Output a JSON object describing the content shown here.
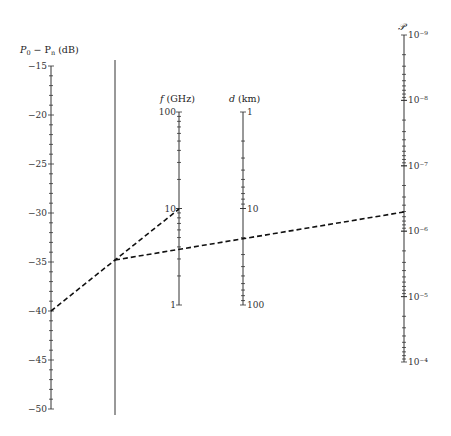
{
  "chart_data": {
    "type": "nomogram",
    "title": "",
    "axes": [
      {
        "id": "power",
        "label": "P0 − Pn (dB)",
        "scale": "linear",
        "range": [
          -15,
          -50
        ],
        "major_ticks": [
          -15,
          -20,
          -25,
          -30,
          -35,
          -40,
          -45,
          -50
        ],
        "tick_labels": [
          "−15",
          "−20",
          "−25",
          "−30",
          "−35",
          "−40",
          "−45",
          "−50"
        ],
        "minor_step": 1
      },
      {
        "id": "pivot",
        "label": "",
        "scale": "none",
        "note": "unlabeled reference (turning) line"
      },
      {
        "id": "frequency",
        "label": "f (GHz)",
        "scale": "log",
        "range": [
          100,
          1
        ],
        "tick_labels": [
          "100",
          "10",
          "1"
        ]
      },
      {
        "id": "distance",
        "label": "d (km)",
        "scale": "log",
        "range": [
          1,
          100
        ],
        "tick_labels": [
          "1",
          "10",
          "100"
        ]
      },
      {
        "id": "probability",
        "label": "𝒫",
        "scale": "log",
        "range": [
          1e-09,
          0.0001
        ],
        "tick_labels": [
          "10⁻⁹",
          "10⁻⁸",
          "10⁻⁷",
          "10⁻⁶",
          "10⁻⁵",
          "10⁻⁴"
        ]
      }
    ],
    "example_lines": [
      {
        "description": "From P0−Pn = −40 dB through pivot to f = 10 GHz",
        "points": [
          {
            "axis": "power",
            "value": -40
          },
          {
            "axis": "pivot",
            "value": "pivot point"
          },
          {
            "axis": "frequency",
            "value": 10
          }
        ]
      },
      {
        "description": "From pivot point through f ≈ 3 GHz and d ≈ 20 km to 𝒫 ≈ 5×10⁻⁷",
        "points": [
          {
            "axis": "pivot",
            "value": "pivot point"
          },
          {
            "axis": "frequency",
            "value": 3
          },
          {
            "axis": "distance",
            "value": 20
          },
          {
            "axis": "probability",
            "value": 5e-07
          }
        ]
      }
    ],
    "grid": false,
    "legend": "none"
  },
  "labels": {
    "power_title_main": "P",
    "power_title_sub0": "0",
    "power_title_mid": " − P",
    "power_title_subn": "n",
    "power_title_unit": " (dB)",
    "freq_title_var": "f",
    "freq_title_unit": " (GHz)",
    "dist_title_var": "d",
    "dist_title_unit": " (km)",
    "prob_title": "𝒫"
  }
}
